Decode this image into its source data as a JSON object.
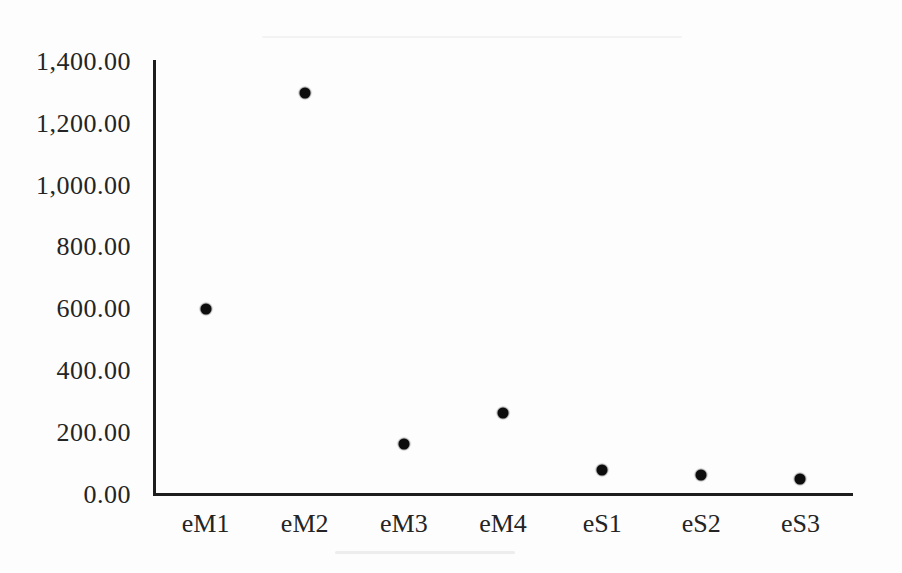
{
  "chart_data": {
    "type": "scatter",
    "title": "",
    "xlabel": "",
    "ylabel": "",
    "categories": [
      "eM1",
      "eM2",
      "eM3",
      "eM4",
      "eS1",
      "eS2",
      "eS3"
    ],
    "values": [
      600,
      1300,
      165,
      265,
      80,
      62,
      50
    ],
    "ylim": [
      0,
      1400
    ],
    "ytick_step": 200,
    "yticks": [
      0,
      200,
      400,
      600,
      800,
      1000,
      1200,
      1400
    ],
    "ytick_labels": [
      "0.00",
      "200.00",
      "400.00",
      "600.00",
      "800.00",
      "1,000.00",
      "1,200.00",
      "1,400.00"
    ],
    "grid": false,
    "legend": "none",
    "marker": {
      "shape": "circle",
      "diameter_px": 11,
      "color": "#0d0d0d"
    },
    "colors": {
      "axis": "#1e1e1e",
      "text": "#242424",
      "background": "#fdfdfd"
    }
  }
}
